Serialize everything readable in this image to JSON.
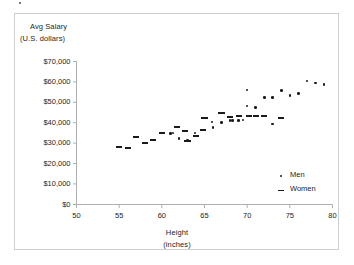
{
  "chart_data": {
    "type": "scatter",
    "title": "",
    "xlabel": "Height (inches)",
    "ylabel": "Avg Salary (U.S. dollars)",
    "xlim": [
      50,
      80
    ],
    "ylim": [
      0,
      70000
    ],
    "grid": false,
    "legend_position": "inside-bottom-right",
    "xticks": [
      50,
      55,
      60,
      65,
      70,
      75,
      80
    ],
    "xtick_labels": [
      "50",
      "55",
      "60",
      "65",
      "70",
      "75",
      "80"
    ],
    "yticks": [
      0,
      10000,
      20000,
      30000,
      40000,
      50000,
      60000,
      70000
    ],
    "ytick_labels": [
      "$0",
      "$10,000",
      "$20,000",
      "$30,000",
      "$40,000",
      "$50,000",
      "$60,000",
      "$70,000"
    ],
    "series": [
      {
        "name": "Men",
        "marker": "dot",
        "color": "#1a1a1a",
        "points": [
          [
            61.0,
            34800
          ],
          [
            61.3,
            35000
          ],
          [
            62.0,
            32200
          ],
          [
            63.0,
            31400
          ],
          [
            63.9,
            34900
          ],
          [
            65.9,
            40300
          ],
          [
            66.0,
            37600
          ],
          [
            67.0,
            40000
          ],
          [
            68.0,
            41000
          ],
          [
            68.3,
            41200
          ],
          [
            69.0,
            41000
          ],
          [
            69.5,
            41400
          ],
          [
            70.0,
            56100
          ],
          [
            70.0,
            48200
          ],
          [
            71.0,
            47500
          ],
          [
            72.0,
            52300
          ],
          [
            73.0,
            52400
          ],
          [
            73.0,
            39400
          ],
          [
            74.0,
            55900
          ],
          [
            75.0,
            53400
          ],
          [
            76.0,
            54200
          ],
          [
            77.0,
            60400
          ],
          [
            78.0,
            59500
          ],
          [
            79.0,
            58800
          ]
        ]
      },
      {
        "name": "Women",
        "marker": "dash",
        "color": "#1a1a1a",
        "points": [
          [
            55.0,
            28100
          ],
          [
            56.0,
            27800
          ],
          [
            57.0,
            33100
          ],
          [
            58.0,
            30300
          ],
          [
            59.0,
            31500
          ],
          [
            60.0,
            35000
          ],
          [
            61.8,
            37700
          ],
          [
            62.7,
            36000
          ],
          [
            63.0,
            31200
          ],
          [
            64.0,
            33400
          ],
          [
            64.8,
            36500
          ],
          [
            65.0,
            42500
          ],
          [
            67.0,
            44900
          ],
          [
            68.0,
            42900
          ],
          [
            69.0,
            43400
          ],
          [
            70.2,
            43400
          ],
          [
            71.0,
            43300
          ],
          [
            72.0,
            43300
          ],
          [
            74.0,
            42500
          ]
        ]
      }
    ]
  },
  "axis_titles": {
    "y_line1": "Avg Salary",
    "y_line2": "(U.S. dollars)",
    "x_line1": "Height",
    "x_line2": "(inches)"
  },
  "legend": {
    "men_label": "Men",
    "women_label": "Women"
  },
  "colors": {
    "marker": "#1a1a1a",
    "axis": "#b0b0b0",
    "frame": "#cfcfcf",
    "text": "#1d1d1d",
    "background": "#ffffff"
  }
}
